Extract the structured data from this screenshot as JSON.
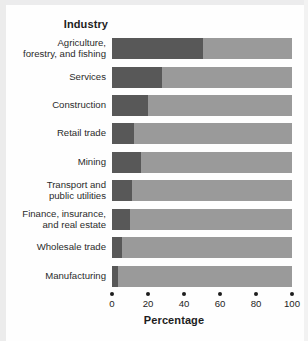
{
  "figure": {
    "group_heading": "Industry",
    "x_axis_title": "Percentage"
  },
  "chart_data": {
    "type": "bar",
    "orientation": "horizontal",
    "stacked": true,
    "title": "",
    "subtitle": "",
    "xlabel": "Percentage",
    "ylabel": "Industry",
    "xlim": [
      0,
      100
    ],
    "xticks": [
      0,
      20,
      40,
      60,
      80,
      100
    ],
    "xticklabels": [
      "0",
      "20",
      "40",
      "60",
      "80",
      "100"
    ],
    "grid": false,
    "legend": "none",
    "colors": {
      "segment_dark": "#585858",
      "segment_light": "#9a9a9a",
      "text": "#1d1d1d",
      "background": "#fefefe"
    },
    "categories": [
      "Agriculture, forestry, and fishing",
      "Services",
      "Construction",
      "Retail trade",
      "Mining",
      "Transport and public utilities",
      "Finance, insurance, and real estate",
      "Wholesale trade",
      "Manufacturing"
    ],
    "series": [
      {
        "name": "dark segment",
        "values": [
          50.5,
          28.0,
          20.0,
          12.0,
          16.0,
          11.0,
          10.0,
          5.5,
          3.5
        ]
      },
      {
        "name": "light segment",
        "values": [
          49.5,
          72.0,
          80.0,
          88.0,
          84.0,
          89.0,
          90.0,
          94.5,
          96.5
        ]
      }
    ]
  },
  "rows": [
    {
      "label_line1": "Agriculture,",
      "label_line2": "forestry, and fishing",
      "value": 50.5
    },
    {
      "label_line1": "Services",
      "label_line2": "",
      "value": 28.0
    },
    {
      "label_line1": "Construction",
      "label_line2": "",
      "value": 20.0
    },
    {
      "label_line1": "Retail trade",
      "label_line2": "",
      "value": 12.0
    },
    {
      "label_line1": "Mining",
      "label_line2": "",
      "value": 16.0
    },
    {
      "label_line1": "Transport and",
      "label_line2": "public utilities",
      "value": 11.0
    },
    {
      "label_line1": "Finance, insurance,",
      "label_line2": "and real estate",
      "value": 10.0
    },
    {
      "label_line1": "Wholesale trade",
      "label_line2": "",
      "value": 5.5
    },
    {
      "label_line1": "Manufacturing",
      "label_line2": "",
      "value": 3.5
    }
  ]
}
